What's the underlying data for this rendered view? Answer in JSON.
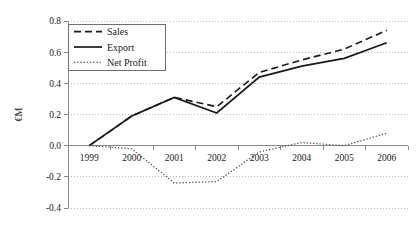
{
  "chart_data": {
    "type": "line",
    "title": "",
    "xlabel": "",
    "ylabel": "€M",
    "categories": [
      "1999",
      "2000",
      "2001",
      "2002",
      "2003",
      "2004",
      "2005",
      "2006"
    ],
    "x": [
      1999,
      2000,
      2001,
      2002,
      2003,
      2004,
      2005,
      2006
    ],
    "series": [
      {
        "name": "Sales",
        "style": "dashed",
        "color": "#1a1a1a",
        "values": [
          0.0,
          0.19,
          0.31,
          0.25,
          0.47,
          0.55,
          0.62,
          0.74
        ]
      },
      {
        "name": "Export",
        "style": "solid",
        "color": "#1a1a1a",
        "values": [
          0.0,
          0.19,
          0.31,
          0.21,
          0.44,
          0.51,
          0.56,
          0.66
        ]
      },
      {
        "name": "Net Profit",
        "style": "dotted",
        "color": "#555555",
        "values": [
          0.0,
          -0.02,
          -0.24,
          -0.23,
          -0.04,
          0.02,
          0.0,
          0.08
        ]
      }
    ],
    "ylim": [
      -0.4,
      0.8
    ],
    "yticks": [
      -0.4,
      -0.2,
      0.0,
      0.2,
      0.4,
      0.6,
      0.8
    ],
    "ytick_labels": [
      "-0.4",
      "-0.2",
      "0.0",
      "0.2",
      "0.4",
      "0.6",
      "0.8"
    ],
    "grid": true,
    "grid_style": "dotted",
    "legend_position": "upper-left-inside",
    "legend_border": true,
    "axis_color": "#888888",
    "zero_line": true
  }
}
